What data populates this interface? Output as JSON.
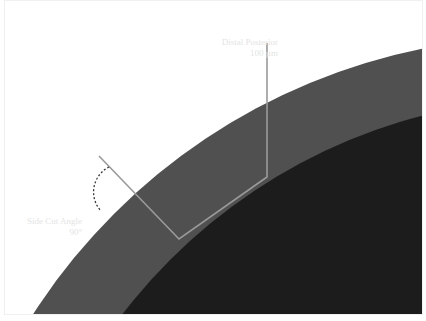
{
  "diagram": {
    "labels": {
      "distal_posterior": {
        "title": "Distal Posterior",
        "value": "100 µm"
      },
      "side_cut_angle": {
        "title": "Side Cut Angle",
        "value": "90°"
      }
    },
    "colors": {
      "background": "#ffffff",
      "outer_layer": "#505050",
      "inner_core": "#1c1c1c",
      "probe_line": "#9a9a9a",
      "label_text": "#e4e4e4"
    }
  }
}
